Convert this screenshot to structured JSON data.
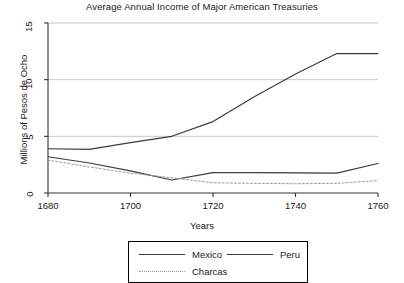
{
  "chart_data": {
    "type": "line",
    "title": "Average Annual Income of Major American Treasuries",
    "xlabel": "Years",
    "ylabel": "Millions of Pesos de Ocho",
    "xlim": [
      1680,
      1760
    ],
    "ylim": [
      0,
      15
    ],
    "xticks": [
      1680,
      1700,
      1720,
      1740,
      1760
    ],
    "xtick_labels": [
      "1680",
      "1700",
      "1720",
      "1740",
      "1760"
    ],
    "yticks": [
      0,
      5,
      10,
      15
    ],
    "ytick_labels": [
      "0",
      "5",
      "10",
      "15"
    ],
    "grid": "horizontal",
    "legend_position": "below-center",
    "series": [
      {
        "name": "Mexico",
        "style": "solid",
        "color": "#3a3a3a",
        "x": [
          1680,
          1690,
          1700,
          1710,
          1720,
          1730,
          1740,
          1750,
          1760
        ],
        "values": [
          3.9,
          3.85,
          4.45,
          5.0,
          6.3,
          8.5,
          10.5,
          12.3,
          12.3
        ]
      },
      {
        "name": "Peru",
        "style": "solid",
        "color": "#3a3a3a",
        "x": [
          1680,
          1690,
          1700,
          1710,
          1720,
          1730,
          1740,
          1750,
          1760
        ],
        "values": [
          3.2,
          2.65,
          1.95,
          1.15,
          1.8,
          1.8,
          1.78,
          1.75,
          2.6
        ]
      },
      {
        "name": "Charcas",
        "style": "dotted",
        "color": "#9a9a9a",
        "x": [
          1680,
          1690,
          1700,
          1710,
          1720,
          1730,
          1740,
          1750,
          1760
        ],
        "values": [
          2.9,
          2.3,
          1.75,
          1.35,
          0.9,
          0.85,
          0.82,
          0.85,
          1.1
        ]
      }
    ]
  },
  "legend": {
    "items": [
      {
        "label": "Mexico"
      },
      {
        "label": "Peru"
      },
      {
        "label": "Charcas"
      }
    ]
  }
}
